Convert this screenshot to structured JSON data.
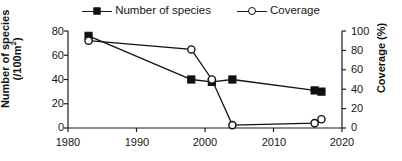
{
  "chart_data": {
    "type": "line",
    "title": "",
    "xlabel": "",
    "ylabel": "Number of species (/100m²)",
    "y2label": "Coverage (%)",
    "x": [
      1983,
      1998,
      2001,
      2004,
      2016,
      2017
    ],
    "xlim": [
      1980,
      2020
    ],
    "ylim": [
      0,
      80
    ],
    "y2lim": [
      0,
      100
    ],
    "xticks": [
      "1980",
      "1990",
      "2000",
      "2010",
      "2020"
    ],
    "yticks": [
      "0",
      "20",
      "40",
      "60",
      "80"
    ],
    "y2ticks": [
      "0",
      "20",
      "40",
      "60",
      "80",
      "100"
    ],
    "grid": false,
    "legend_position": "top-center",
    "series": [
      {
        "name": "Number of species",
        "axis": "left",
        "marker": "filled-square",
        "color": "#111111",
        "x": [
          1983,
          1998,
          2001,
          2004,
          2016,
          2017
        ],
        "values": [
          76,
          40,
          38,
          40,
          31,
          30
        ]
      },
      {
        "name": "Coverage",
        "axis": "right",
        "marker": "open-circle",
        "color": "#111111",
        "x": [
          1983,
          1998,
          2001,
          2004,
          2016,
          2017
        ],
        "values": [
          90,
          81,
          50,
          3,
          5,
          9
        ]
      }
    ]
  },
  "legend": {
    "entries": [
      {
        "label": "Number of species",
        "marker": "filled-square"
      },
      {
        "label": "Coverage",
        "marker": "open-circle"
      }
    ]
  },
  "axes": {
    "left": {
      "title_line1": "Number of species",
      "title_line2_prefix": "(/100m",
      "title_line2_sup": "2",
      "title_line2_suffix": ")",
      "ticks": [
        "80",
        "60",
        "40",
        "20",
        "0"
      ]
    },
    "right": {
      "title": "Coverage (%)",
      "ticks": [
        "100",
        "80",
        "60",
        "40",
        "20",
        "0"
      ]
    },
    "bottom": {
      "ticks": [
        "1980",
        "1990",
        "2000",
        "2010",
        "2020"
      ]
    }
  }
}
